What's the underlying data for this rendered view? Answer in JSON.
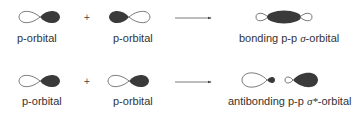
{
  "colors": {
    "lobe_filled": "#3a3a3a",
    "lobe_outline": "#555555",
    "text": "#333333",
    "arrow": "#444444"
  },
  "rows": [
    {
      "reactants": [
        {
          "label": "p-orbital",
          "filled_side": "right"
        },
        {
          "label": "p-orbital",
          "filled_side": "left"
        }
      ],
      "operator": "+",
      "product": {
        "label_prefix": "bonding p-p ",
        "greek": "σ",
        "label_suffix": "-orbital",
        "type": "bonding"
      }
    },
    {
      "reactants": [
        {
          "label": "p-orbital",
          "filled_side": "right"
        },
        {
          "label": "p-orbital",
          "filled_side": "right"
        }
      ],
      "operator": "+",
      "product": {
        "label_prefix": "antibonding p-p ",
        "greek": "σ*",
        "label_suffix": "-orbital",
        "type": "antibonding"
      }
    }
  ]
}
